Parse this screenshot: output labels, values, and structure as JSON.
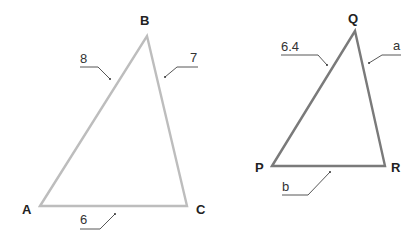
{
  "diagram": {
    "type": "similar-triangles",
    "triangles": [
      {
        "name": "ABC",
        "stroke_color": "#bdbdbd",
        "vertices": [
          {
            "label": "A",
            "x": 40,
            "y": 206
          },
          {
            "label": "B",
            "x": 147,
            "y": 36
          },
          {
            "label": "C",
            "x": 187,
            "y": 206
          }
        ],
        "sides": [
          {
            "between": "AB",
            "label": "8"
          },
          {
            "between": "BC",
            "label": "7"
          },
          {
            "between": "AC",
            "label": "6"
          }
        ]
      },
      {
        "name": "PQR",
        "stroke_color": "#7a7a7a",
        "vertices": [
          {
            "label": "P",
            "x": 272,
            "y": 166
          },
          {
            "label": "Q",
            "x": 355,
            "y": 31
          },
          {
            "label": "R",
            "x": 385,
            "y": 166
          }
        ],
        "sides": [
          {
            "between": "PQ",
            "label": "6.4"
          },
          {
            "between": "QR",
            "label": "a"
          },
          {
            "between": "PR",
            "label": "b"
          }
        ]
      }
    ]
  },
  "labels": {
    "A": "A",
    "B": "B",
    "C": "C",
    "P": "P",
    "Q": "Q",
    "R": "R",
    "AB": "8",
    "BC": "7",
    "AC": "6",
    "PQ": "6.4",
    "QR": "a",
    "PR": "b"
  }
}
